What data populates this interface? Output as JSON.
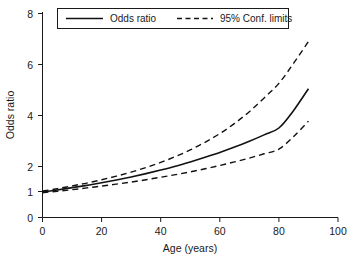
{
  "chart_data": {
    "type": "line",
    "title": "",
    "xlabel": "Age (years)",
    "ylabel": "Odds ratio",
    "xlim": [
      0,
      100
    ],
    "ylim": [
      0,
      8
    ],
    "xticks": [
      0,
      20,
      40,
      60,
      80,
      100
    ],
    "xtick_labels": [
      "0",
      "20",
      "40",
      "60",
      "80",
      "100"
    ],
    "yticks": [
      0,
      1,
      2,
      4,
      6,
      8
    ],
    "ytick_labels": [
      "0",
      "1",
      "2",
      "4",
      "6",
      "8"
    ],
    "grid": false,
    "legend_position": "top-center",
    "x": [
      0,
      5,
      10,
      15,
      20,
      25,
      30,
      35,
      40,
      45,
      50,
      55,
      60,
      65,
      70,
      75,
      80,
      85,
      90
    ],
    "series": [
      {
        "name": "Odds ratio",
        "style": "solid",
        "color": "#111111",
        "values": [
          1.0,
          1.08,
          1.17,
          1.26,
          1.36,
          1.47,
          1.59,
          1.72,
          1.86,
          2.01,
          2.18,
          2.36,
          2.55,
          2.76,
          2.99,
          3.24,
          3.51,
          4.2,
          5.05
        ]
      },
      {
        "name": "Upper 95% confidence limit",
        "style": "dashed",
        "color": "#111111",
        "values": [
          1.04,
          1.13,
          1.24,
          1.35,
          1.48,
          1.62,
          1.78,
          1.96,
          2.16,
          2.39,
          2.65,
          2.95,
          3.29,
          3.69,
          4.15,
          4.69,
          5.26,
          6.05,
          6.9
        ]
      },
      {
        "name": "Lower 95% confidence limit",
        "style": "dashed",
        "color": "#111111",
        "values": [
          0.97,
          1.03,
          1.09,
          1.16,
          1.23,
          1.31,
          1.39,
          1.48,
          1.58,
          1.68,
          1.79,
          1.91,
          2.04,
          2.18,
          2.33,
          2.5,
          2.68,
          3.18,
          3.78
        ]
      }
    ],
    "legend": [
      {
        "label": "Odds ratio",
        "style": "solid"
      },
      {
        "label": "95% Conf. limits",
        "style": "dashed"
      }
    ]
  }
}
